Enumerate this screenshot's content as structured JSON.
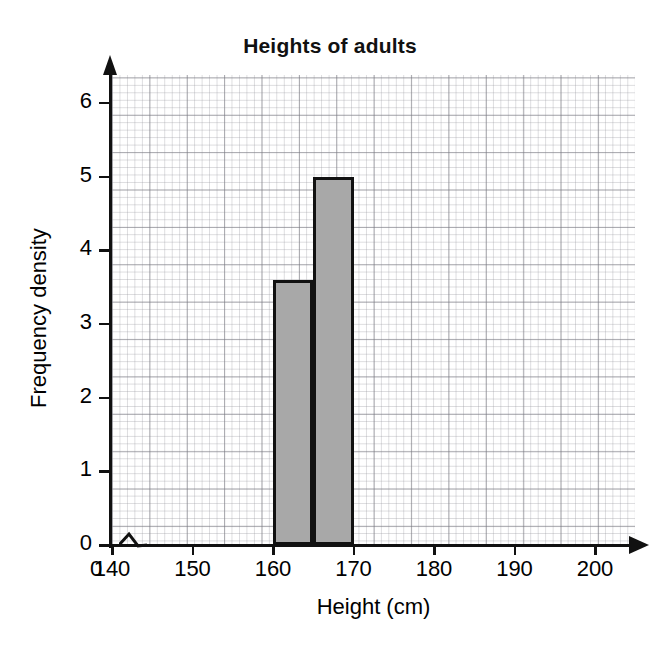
{
  "chart_data": {
    "type": "bar",
    "title": "Heights of adults",
    "xlabel": "Height (cm)",
    "ylabel": "Frequency density",
    "xlim": [
      140,
      205
    ],
    "ylim": [
      0,
      6.4
    ],
    "grid": true,
    "grid_style": "graph-paper",
    "legend": "none",
    "axis_break_x": true,
    "x_tick_labels": [
      "0",
      "140",
      "150",
      "160",
      "170",
      "180",
      "190",
      "200"
    ],
    "x_tick_values": [
      0,
      140,
      150,
      160,
      170,
      180,
      190,
      200
    ],
    "y_tick_labels": [
      "0",
      "1",
      "2",
      "3",
      "4",
      "5",
      "6"
    ],
    "y_tick_values": [
      0,
      1,
      2,
      3,
      4,
      5,
      6
    ],
    "bars": [
      {
        "label": "160-165",
        "x_start": 160,
        "x_end": 165,
        "value": 3.6
      },
      {
        "label": "165-170",
        "x_start": 165,
        "x_end": 170,
        "value": 5.0
      }
    ],
    "categories": [
      "160-165",
      "165-170"
    ],
    "values": [
      3.6,
      5.0
    ],
    "bar_fill_color": "#a8a8a8",
    "bar_edge_color": "#111111"
  }
}
